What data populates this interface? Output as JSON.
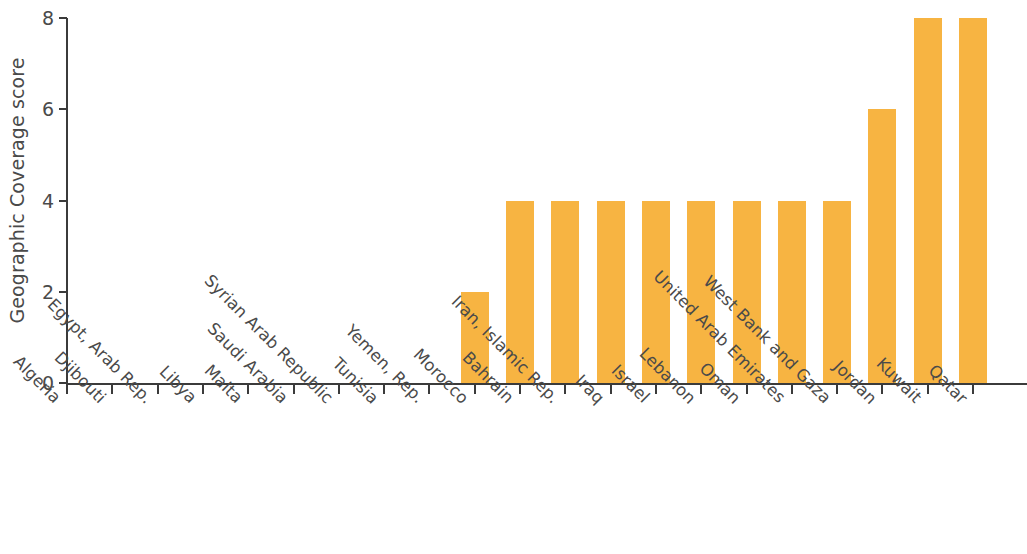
{
  "chart_data": {
    "type": "bar",
    "title": "",
    "xlabel": "",
    "ylabel": "Geographic Coverage score",
    "ylim": [
      0,
      8
    ],
    "yticks": [
      0,
      2,
      4,
      6,
      8
    ],
    "ytick_labels": [
      "0",
      "2",
      "4",
      "6",
      "8"
    ],
    "grid": false,
    "legend": "none",
    "bar_color": "#f7b442",
    "axis_color": "#3b3b3b",
    "text_color": "#4a4a4a",
    "categories": [
      "Algeria",
      "Djibouti",
      "Egypt, Arab Rep.",
      "Libya",
      "Malta",
      "Saudi Arabia",
      "Syrian Arab Republic",
      "Tunisia",
      "Yemen, Rep.",
      "Morocco",
      "Bahrain",
      "Iran, Islamic Rep.",
      "Iraq",
      "Israel",
      "Lebanon",
      "Oman",
      "United Arab Emirates",
      "West Bank and Gaza",
      "Jordan",
      "Kuwait",
      "Qatar"
    ],
    "values": [
      0,
      0,
      0,
      0,
      0,
      0,
      0,
      0,
      0,
      2,
      4,
      4,
      4,
      4,
      4,
      4,
      4,
      4,
      6,
      8,
      8
    ]
  }
}
